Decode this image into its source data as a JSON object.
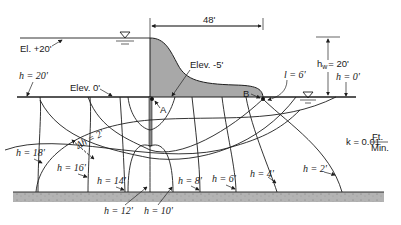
{
  "diagram": {
    "colors": {
      "dam_fill": "#a8a8a8",
      "ground": "#b3b3b3",
      "line": "#1e1e1e",
      "background": "#ffffff"
    },
    "labels": {
      "dam_width": "48'",
      "headwater_elevation": "El. +20'",
      "ground_elevation": "Elev. 0'",
      "dam_base_elevation": "Elev. -5'",
      "head_upstream": "h = 20'",
      "head_downstream": "h = 0'",
      "head_loss": "h",
      "head_loss_sub": "w",
      "head_loss_value": "= 20'",
      "exit_length": "l = 6'",
      "point_a": "A",
      "point_b": "B",
      "delta_h": "Δh = 2'",
      "permeability_prefix": "k = 0.01",
      "permeability_num": "Ft.",
      "permeability_den": "Min."
    },
    "equipotentials": [
      {
        "label": "h = 18'"
      },
      {
        "label": "h = 16'"
      },
      {
        "label": "h = 14'"
      },
      {
        "label": "h = 12'"
      },
      {
        "label": "h = 10'"
      },
      {
        "label": "h = 8'"
      },
      {
        "label": "h = 6'"
      },
      {
        "label": "h = 4'"
      },
      {
        "label": "h = 2'"
      }
    ]
  }
}
